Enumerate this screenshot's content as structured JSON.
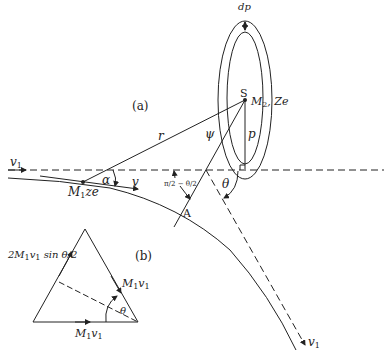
{
  "figure": {
    "panel_a_label": "(a)",
    "panel_b_label": "(b)",
    "labels": {
      "d_rho": "dp",
      "S": "S",
      "M2": "M",
      "M2_sub": "2",
      "M2_charge": ", Ze",
      "r": "r",
      "psi": "ψ",
      "p": "p",
      "v1_in": "v",
      "v1_in_sub": "1",
      "alpha": "α",
      "v": "v",
      "M1": "M",
      "M1_sub": "1",
      "M1_charge": "ze",
      "half_angle": "π/2 − θ/2",
      "theta_a": "θ",
      "A": "A",
      "v1_out": "v",
      "v1_out_sub": "1"
    },
    "triangle": {
      "left_side": "2M",
      "left_side_sub": "1",
      "left_side_rest": "v",
      "left_side_sub2": "1",
      "left_side_sin": " sin θ/2",
      "right_side": "M",
      "right_side_sub": "1",
      "right_side_v": "v",
      "right_side_sub2": "1",
      "bottom_side": "M",
      "bottom_side_sub": "1",
      "bottom_side_v": "v",
      "bottom_side_sub2": "1",
      "theta": "θ"
    },
    "colors": {
      "ink": "#222222",
      "background": "#ffffff"
    }
  }
}
